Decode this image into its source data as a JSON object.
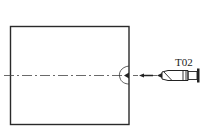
{
  "diagram": {
    "type": "machining-setup",
    "workpiece": {
      "shape": "rectangle",
      "x": 10,
      "y": 26,
      "width": 119,
      "height": 98
    },
    "centerline": {
      "y": 75,
      "x_start": 4,
      "x_end": 157,
      "style": "dash-dot"
    },
    "center_drill_mark": {
      "x": 129,
      "y": 75
    },
    "feed_arrow": {
      "direction": "left",
      "x_start": 152,
      "x_end": 140,
      "y": 75
    },
    "tool": {
      "label": "T02",
      "name": "center-drill",
      "tip_x": 157,
      "end_x": 200,
      "y": 75
    },
    "colors": {
      "stroke": "#2a2a2a",
      "background": "#ffffff"
    }
  }
}
